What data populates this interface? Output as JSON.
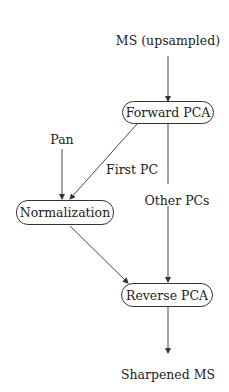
{
  "diagram": {
    "type": "flowchart",
    "colors": {
      "line": "#333333",
      "text": "#222222",
      "background": "#ffffff"
    },
    "inputs": {
      "ms": "MS (upsampled)",
      "pan": "Pan"
    },
    "nodes": {
      "forward_pca": "Forward PCA",
      "normalization": "Normalization",
      "reverse_pca": "Reverse PCA"
    },
    "edge_labels": {
      "first_pc": "First PC",
      "other_pcs": "Other PCs"
    },
    "output": "Sharpened MS",
    "edges": [
      {
        "from": "MS (upsampled)",
        "to": "Forward PCA"
      },
      {
        "from": "Forward PCA",
        "to": "Normalization",
        "label": "First PC"
      },
      {
        "from": "Pan",
        "to": "Normalization"
      },
      {
        "from": "Forward PCA",
        "to": "Reverse PCA",
        "label": "Other PCs"
      },
      {
        "from": "Normalization",
        "to": "Reverse PCA"
      },
      {
        "from": "Reverse PCA",
        "to": "Sharpened MS"
      }
    ]
  }
}
